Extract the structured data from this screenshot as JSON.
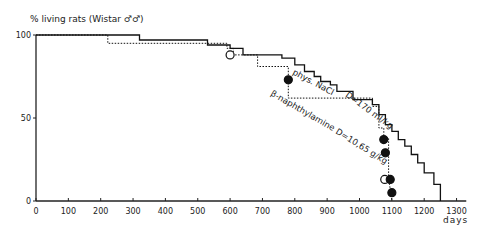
{
  "chart_data": {
    "type": "line",
    "title": "% living rats (Wistar ♂♂)",
    "ylabel": "% living rats (Wistar ♂♂)",
    "xlabel": "days",
    "xlim": [
      0,
      1300
    ],
    "ylim": [
      0,
      100
    ],
    "x_ticks": [
      0,
      100,
      200,
      300,
      400,
      500,
      600,
      700,
      800,
      900,
      1000,
      1100,
      1200,
      1300
    ],
    "y_ticks": [
      0,
      50,
      100
    ],
    "grid": false,
    "legend": "inline annotations",
    "series": [
      {
        "name": "phys. NaCl  D=170 ml/kg",
        "style": "solid step",
        "x": [
          0,
          320,
          320,
          530,
          530,
          600,
          600,
          640,
          640,
          760,
          760,
          800,
          800,
          830,
          830,
          860,
          860,
          880,
          880,
          910,
          910,
          930,
          930,
          980,
          980,
          1040,
          1040,
          1060,
          1060,
          1080,
          1080,
          1100,
          1100,
          1120,
          1120,
          1140,
          1140,
          1160,
          1160,
          1180,
          1180,
          1200,
          1200,
          1230,
          1230,
          1250,
          1250
        ],
        "y": [
          100,
          100,
          97,
          97,
          94,
          94,
          92,
          92,
          88,
          88,
          86,
          86,
          82,
          82,
          78,
          78,
          75,
          75,
          72,
          72,
          70,
          70,
          66,
          66,
          61,
          61,
          58,
          58,
          52,
          52,
          46,
          46,
          42,
          42,
          37,
          37,
          33,
          33,
          28,
          28,
          23,
          23,
          17,
          17,
          10,
          10,
          0
        ]
      },
      {
        "name": "β-naphthylamine  D=10.65 g/kg",
        "style": "dotted step",
        "x": [
          0,
          222,
          222,
          590,
          590,
          610,
          610,
          685,
          685,
          780,
          780,
          1040,
          1040,
          1060,
          1060,
          1075,
          1075,
          1090,
          1090,
          1100
        ],
        "y": [
          100,
          100,
          95,
          95,
          92,
          92,
          88,
          88,
          81,
          81,
          62,
          62,
          57,
          57,
          44,
          44,
          38,
          38,
          14,
          0
        ]
      }
    ],
    "markers": [
      {
        "x": 600,
        "y": 88,
        "type": "open circle"
      },
      {
        "x": 780,
        "y": 73,
        "type": "filled circle"
      },
      {
        "x": 1075,
        "y": 37,
        "type": "filled circle"
      },
      {
        "x": 1080,
        "y": 29,
        "type": "filled circle"
      },
      {
        "x": 1078,
        "y": 13,
        "type": "open circle"
      },
      {
        "x": 1095,
        "y": 13,
        "type": "filled circle"
      },
      {
        "x": 1100,
        "y": 5,
        "type": "filled circle"
      }
    ],
    "annotations": [
      {
        "text": "phys. NaCl",
        "x": 790,
        "y": 95
      },
      {
        "text": "D=170 ml/kg",
        "x": 1030,
        "y": 72
      },
      {
        "text": "β-naphthylamine",
        "x": 780,
        "y": 56
      },
      {
        "text": "D=10,65 g/kg",
        "x": 900,
        "y": 40
      }
    ]
  },
  "labels": {
    "y_title": "% living rats   (Wistar ♂♂)",
    "x_title": "days",
    "anno_nacl": "phys. NaCl",
    "anno_nacl_dose": "D=170 ml/kg",
    "anno_bna": "β-naphthylamine",
    "anno_bna_dose": "D=10,65 g/kg"
  }
}
